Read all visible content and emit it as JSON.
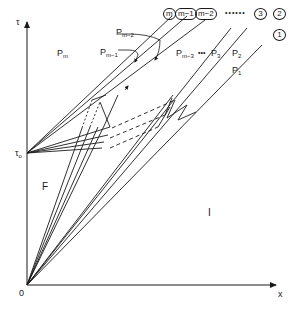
{
  "diagram": {
    "axes": {
      "y_label": "τ",
      "x_label": "x",
      "origin_label": "0",
      "tau0_label": "τ",
      "tau0_sub": "o"
    },
    "regions": {
      "F": "F",
      "I": "I",
      "Pm": {
        "base": "P",
        "sub": "m"
      },
      "Pm1": {
        "base": "P",
        "sub": "m−1"
      },
      "Pm2": {
        "base": "P",
        "sub": "m−2"
      },
      "Pm3": {
        "base": "P",
        "sub": "m−3"
      },
      "ellipsis_mid": "•••",
      "P3": {
        "base": "P",
        "sub": "3"
      },
      "P2": {
        "base": "P",
        "sub": "2"
      },
      "P1": {
        "base": "P",
        "sub": "1"
      }
    },
    "wave_labels": {
      "m": "m",
      "m1": "m−1",
      "m2": "m−2",
      "dots": "••••••",
      "w3": "3",
      "w2": "2",
      "w1": "1"
    },
    "colors": {
      "line": "#1a1a1a",
      "background": "#ffffff"
    }
  }
}
